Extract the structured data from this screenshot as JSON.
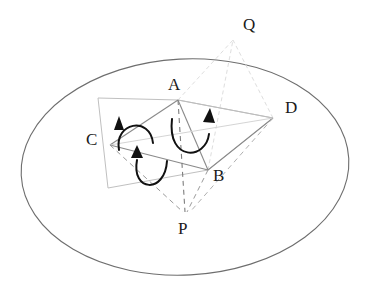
{
  "figure": {
    "background_color": "#ffffff",
    "ink_color": "#2b2b2b"
  },
  "ellipse": {
    "name": "bounding-ellipse",
    "cx": 185,
    "cy": 167,
    "rx": 164,
    "ry": 108,
    "rotation_deg": -3,
    "stroke": "#6e6e6e",
    "stroke_width": 1.1,
    "fill": "none"
  },
  "vertices": [
    {
      "id": "A",
      "label": "A",
      "x": 178,
      "y": 100,
      "label_x": 168,
      "label_y": 78
    },
    {
      "id": "B",
      "label": "B",
      "x": 208,
      "y": 170,
      "label_x": 213,
      "label_y": 170
    },
    {
      "id": "C",
      "label": "C",
      "x": 110,
      "y": 145,
      "label_x": 87,
      "label_y": 133
    },
    {
      "id": "D",
      "label": "D",
      "x": 273,
      "y": 118,
      "label_x": 285,
      "label_y": 101
    },
    {
      "id": "P",
      "label": "P",
      "x": 185,
      "y": 215,
      "label_x": 179,
      "label_y": 222
    },
    {
      "id": "Q",
      "label": "Q",
      "x": 233,
      "y": 40,
      "label_x": 243,
      "label_y": 18
    }
  ],
  "quadrilateral": {
    "name": "base-parallelogram",
    "stroke": "#b9b9b9",
    "stroke_width": 1.0,
    "points": [
      {
        "x": 98,
        "y": 98
      },
      {
        "x": 178,
        "y": 100
      },
      {
        "x": 273,
        "y": 118
      },
      {
        "x": 208,
        "y": 170
      },
      {
        "x": 108,
        "y": 188
      }
    ],
    "corner_notes": "light gray outline passing through A, D, B region"
  },
  "solid_edges": [
    {
      "name": "edge-AC",
      "from": "A",
      "to": "C",
      "stroke": "#8a8a8a",
      "dash": "none"
    },
    {
      "name": "edge-AB",
      "from": "A",
      "to": "B",
      "stroke": "#8a8a8a",
      "dash": "none"
    },
    {
      "name": "edge-AD",
      "from": "A",
      "to": "D",
      "stroke": "#b5b5b5",
      "dash": "none"
    },
    {
      "name": "edge-CB",
      "from": "C",
      "to": "B",
      "stroke": "#8a8a8a",
      "dash": "none"
    },
    {
      "name": "edge-BD",
      "from": "B",
      "to": "D",
      "stroke": "#8a8a8a",
      "dash": "none"
    }
  ],
  "dashed_edges": [
    {
      "name": "edge-AP",
      "from": "A",
      "to": "P",
      "stroke": "#7d7d7d",
      "dash": "5,4"
    },
    {
      "name": "edge-CP",
      "from": "C",
      "to": "P",
      "stroke": "#9a9a9a",
      "dash": "5,4"
    },
    {
      "name": "edge-BP",
      "from": "B",
      "to": "P",
      "stroke": "#9a9a9a",
      "dash": "5,4"
    },
    {
      "name": "edge-DP",
      "from": "D",
      "to": "P",
      "stroke": "#b0b0b0",
      "dash": "5,4"
    }
  ],
  "light_edges": [
    {
      "name": "edge-AQ",
      "from": "A",
      "to": "Q",
      "stroke": "#dcdcdc",
      "dash": "4,3"
    },
    {
      "name": "edge-BQ",
      "from": "B",
      "to": "Q",
      "stroke": "#dcdcdc",
      "dash": "4,3"
    },
    {
      "name": "edge-DQ",
      "from": "D",
      "to": "Q",
      "stroke": "#dcdcdc",
      "dash": "4,3"
    }
  ],
  "arrows": [
    {
      "name": "rotation-arrow-left",
      "path": "M 118 148 C 116 120, 150 118, 152 142",
      "arrow_at": "start",
      "direction": "up",
      "stroke": "#111111",
      "stroke_width": 2.0
    },
    {
      "name": "rotation-arrow-right",
      "path": "M 171 120 C 168 160, 206 158, 208 132",
      "arrow_at": "end",
      "direction": "up",
      "stroke": "#111111",
      "stroke_width": 2.0
    },
    {
      "name": "rotation-arrow-bottom",
      "path": "M 136 158 C 132 190, 164 192, 166 160",
      "arrow_at": "start",
      "direction": "up",
      "stroke": "#111111",
      "stroke_width": 2.0
    }
  ]
}
